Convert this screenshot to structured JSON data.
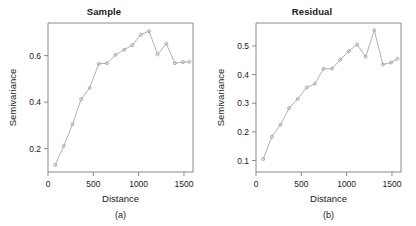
{
  "figure": {
    "panels": [
      {
        "key": "sample",
        "title": "Sample",
        "caption": "(a)",
        "xlabel": "Distance",
        "ylabel": "Semivariance"
      },
      {
        "key": "residual",
        "title": "Residual",
        "caption": "(b)",
        "xlabel": "Distance",
        "ylabel": "Semivariance"
      }
    ]
  },
  "chart_data": [
    {
      "type": "line",
      "key": "sample",
      "title": "Sample",
      "caption": "(a)",
      "xlabel": "Distance",
      "ylabel": "Semivariance",
      "xlim": [
        0,
        1600
      ],
      "ylim": [
        0.1,
        0.74
      ],
      "xticks": [
        0,
        500,
        1000,
        1500
      ],
      "xtick_labels": [
        "0",
        "500",
        "1000",
        "1500"
      ],
      "yticks": [
        0.2,
        0.4,
        0.6
      ],
      "ytick_labels": [
        "0.2",
        "0.4",
        "0.6"
      ],
      "grid": false,
      "legend": "none",
      "marker": "open-circle",
      "line_color": "#a8a8a8",
      "x": [
        80,
        175,
        270,
        365,
        460,
        560,
        650,
        745,
        840,
        930,
        1025,
        1115,
        1210,
        1305,
        1400,
        1490,
        1560
      ],
      "y": [
        0.13,
        0.213,
        0.305,
        0.412,
        0.462,
        0.565,
        0.567,
        0.603,
        0.625,
        0.645,
        0.69,
        0.705,
        0.605,
        0.652,
        0.567,
        0.572,
        0.573
      ]
    },
    {
      "type": "line",
      "key": "residual",
      "title": "Residual",
      "caption": "(b)",
      "xlabel": "Distance",
      "ylabel": "Semivariance",
      "xlim": [
        0,
        1600
      ],
      "ylim": [
        0.06,
        0.58
      ],
      "xticks": [
        0,
        500,
        1000,
        1500
      ],
      "xtick_labels": [
        "0",
        "500",
        "1000",
        "1500"
      ],
      "yticks": [
        0.1,
        0.2,
        0.3,
        0.4,
        0.5
      ],
      "ytick_labels": [
        "0.1",
        "0.2",
        "0.3",
        "0.4",
        "0.5"
      ],
      "grid": false,
      "legend": "none",
      "marker": "open-circle",
      "line_color": "#a8a8a8",
      "x": [
        80,
        175,
        270,
        365,
        460,
        560,
        650,
        745,
        840,
        930,
        1025,
        1115,
        1210,
        1305,
        1400,
        1490,
        1560
      ],
      "y": [
        0.105,
        0.183,
        0.225,
        0.283,
        0.315,
        0.355,
        0.368,
        0.42,
        0.421,
        0.452,
        0.482,
        0.505,
        0.462,
        0.555,
        0.435,
        0.442,
        0.455
      ]
    }
  ]
}
